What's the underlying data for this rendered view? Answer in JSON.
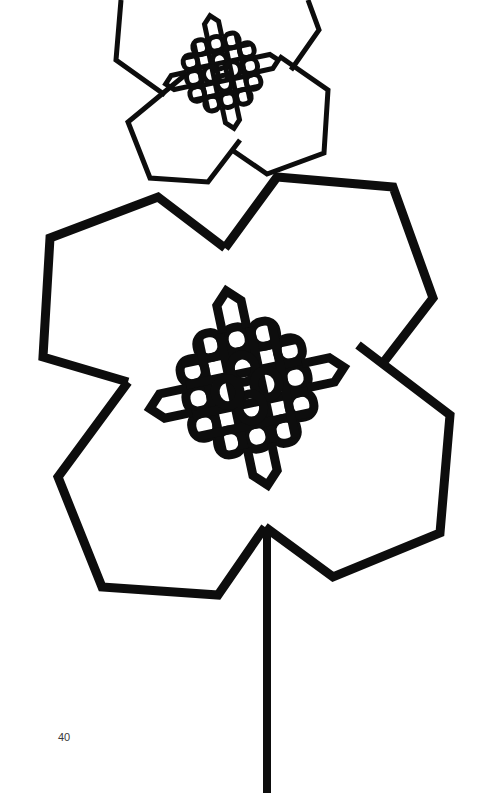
{
  "page": {
    "number": "40",
    "background": "#ffffff",
    "ink": "#0d0d0d"
  },
  "illustration": {
    "subject": "stylized-flowers",
    "flowers": [
      {
        "name": "large-flower",
        "center": [
          247,
          388
        ],
        "stroke": 9,
        "petals": [
          [
            [
              225,
              248
            ],
            [
              158,
              197
            ],
            [
              50,
              238
            ],
            [
              43,
              357
            ],
            [
              128,
              382
            ]
          ],
          [
            [
              225,
              248
            ],
            [
              277,
              177
            ],
            [
              393,
              187
            ],
            [
              433,
              298
            ],
            [
              383,
              363
            ]
          ],
          [
            [
              358,
              345
            ],
            [
              450,
              415
            ],
            [
              440,
              533
            ],
            [
              333,
              577
            ],
            [
              265,
              527
            ]
          ],
          [
            [
              128,
              382
            ],
            [
              58,
              477
            ],
            [
              102,
              587
            ],
            [
              218,
              595
            ],
            [
              265,
              527
            ]
          ]
        ],
        "arms": [
          [
            [
              205,
              270
            ],
            [
              227,
              248
            ],
            [
              250,
              267
            ],
            [
              250,
              300
            ]
          ],
          [
            [
              205,
              300
            ],
            [
              205,
              270
            ]
          ],
          [
            [
              358,
              345
            ],
            [
              383,
              363
            ],
            [
              358,
              390
            ],
            [
              330,
              395
            ]
          ],
          [
            [
              128,
              382
            ],
            [
              150,
              405
            ],
            [
              170,
              405
            ]
          ],
          [
            [
              243,
              480
            ],
            [
              243,
              510
            ],
            [
              265,
              527
            ],
            [
              287,
              505
            ],
            [
              287,
              478
            ]
          ]
        ],
        "stem": [
          [
            267,
            527
          ],
          [
            267,
            793
          ]
        ]
      },
      {
        "name": "small-flower",
        "center": [
          222,
          72
        ],
        "stroke": 5,
        "petals": [
          [
            [
              165,
              95
            ],
            [
              116,
              60
            ],
            [
              121,
              0
            ]
          ],
          [
            [
              291,
              70
            ],
            [
              319,
              30
            ],
            [
              308,
              0
            ]
          ],
          [
            [
              279,
              56
            ],
            [
              328,
              90
            ],
            [
              324,
              153
            ],
            [
              267,
              174
            ],
            [
              232,
              150
            ]
          ],
          [
            [
              185,
              75
            ],
            [
              128,
              122
            ],
            [
              150,
              178
            ],
            [
              208,
              182
            ],
            [
              240,
              140
            ]
          ]
        ],
        "arms": [
          [
            [
              208,
              45
            ],
            [
              208,
              15
            ],
            [
              221,
              5
            ],
            [
              234,
              15
            ],
            [
              234,
              45
            ]
          ],
          [
            [
              165,
              95
            ],
            [
              173,
              77
            ],
            [
              190,
              73
            ]
          ],
          [
            [
              262,
              57
            ],
            [
              280,
              55
            ],
            [
              292,
              68
            ],
            [
              285,
              80
            ],
            [
              262,
              83
            ]
          ],
          [
            [
              216,
              110
            ],
            [
              216,
              130
            ],
            [
              230,
              140
            ],
            [
              242,
              130
            ],
            [
              242,
              110
            ]
          ]
        ]
      }
    ]
  }
}
